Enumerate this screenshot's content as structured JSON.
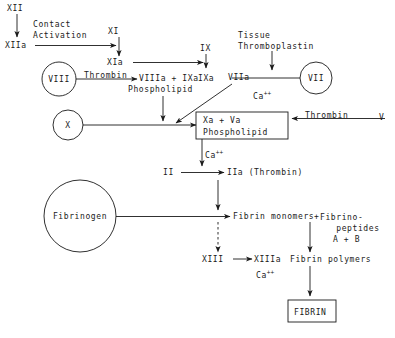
{
  "diagram": {
    "nodes": {
      "xii": "XII",
      "contact_activation": "Contact\nActivation",
      "xiia": "XIIa",
      "xi": "XI",
      "xia": "XIa",
      "ix": "IX",
      "ixa": "IXa",
      "viii_circle": "VIII",
      "thrombin_viii": "Thrombin",
      "viiia_ixa": "VIIIa + IXa",
      "phospholipid_1": "Phospholipid",
      "tissue_thromboplastin": "Tissue\nThromboplastin",
      "viia": "VIIa",
      "vii_circle": "VII",
      "ca_viia": "Ca",
      "ca_viia_sup": "++",
      "x_circle": "X",
      "xa_va": "Xa + Va",
      "phospholipid_2": "Phospholipid",
      "thrombin_v": "Thrombin",
      "v": "V",
      "ca_prothrombin": "Ca",
      "ca_prothrombin_sup": "++",
      "ii": "II",
      "iia_thrombin": "IIa (Thrombin)",
      "fibrinogen": "Fibrinogen",
      "fibrin_monomers": "Fibrin monomers",
      "plus_sign": "+",
      "fibrinopeptides": "Fibrino-\n   peptides",
      "a_plus_b": "A + B",
      "xiii": "XIII",
      "xiiia": "XIIIa",
      "ca_xiii": "Ca",
      "ca_xiii_sup": "++",
      "fibrin_polymers": "Fibrin polymers",
      "fibrin_box": "FIBRIN"
    },
    "colors": {
      "stroke": "#1a1a1a",
      "background": "#ffffff",
      "text": "#1a1a1a"
    }
  }
}
